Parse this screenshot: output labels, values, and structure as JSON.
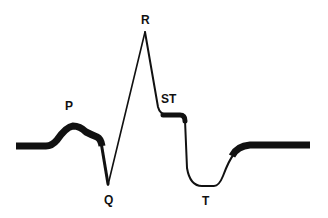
{
  "diagram": {
    "line_color": "#111111",
    "background": "#ffffff",
    "labels": {
      "p": "P",
      "q": "Q",
      "r": "R",
      "st": "ST",
      "t": "T"
    }
  }
}
